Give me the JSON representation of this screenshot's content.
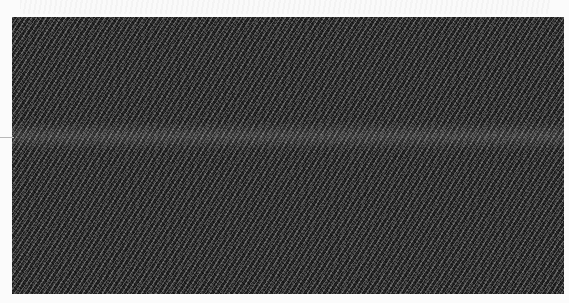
{
  "image": {
    "subject": "dark grey noise texture",
    "colors": {
      "background": "#fbfbfb",
      "texture_base": "#2a2a2a",
      "texture_highlight": "#bebebe",
      "band": "#4a4a4a"
    }
  }
}
